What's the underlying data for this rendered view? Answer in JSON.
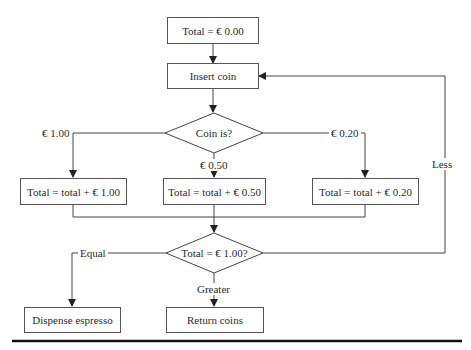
{
  "diagram": {
    "type": "flowchart",
    "nodes": {
      "start": "Total = € 0.00",
      "insert": "Insert coin",
      "coin_decision": "Coin is?",
      "add_100": "Total = total +  € 1.00",
      "add_050": "Total = total +  € 0.50",
      "add_020": "Total = total +  € 0.20",
      "total_decision": "Total = € 1.00?",
      "dispense": "Dispense espresso",
      "return": "Return coins"
    },
    "edge_labels": {
      "coin_100": "€ 1.00",
      "coin_050": "€ 0.50",
      "coin_020": "€ 0.20",
      "equal": "Equal",
      "greater": "Greater",
      "less": "Less"
    },
    "colors": {
      "line": "#444444",
      "thick_rule": "#111111",
      "background": "#ffffff"
    }
  }
}
